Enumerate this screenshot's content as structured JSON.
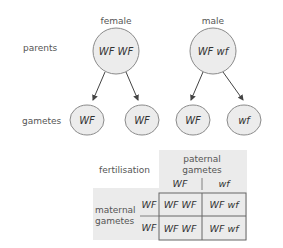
{
  "diagram": {
    "row_labels": {
      "parents": "parents",
      "gametes": "gametes"
    },
    "parents": [
      {
        "sex_label": "female",
        "genotype": "WF WF"
      },
      {
        "sex_label": "male",
        "genotype": "WF wf"
      }
    ],
    "gametes": [
      {
        "allele": "WF",
        "parent": "female"
      },
      {
        "allele": "WF",
        "parent": "female"
      },
      {
        "allele": "WF",
        "parent": "male"
      },
      {
        "allele": "wf",
        "parent": "male"
      }
    ],
    "punnett": {
      "title": "fertilisation",
      "column_header_line1": "paternal",
      "column_header_line2": "gametes",
      "row_header_line1": "maternal",
      "row_header_line2": "gametes",
      "columns": [
        "WF",
        "wf"
      ],
      "rows": [
        "WF",
        "WF"
      ],
      "cells": [
        [
          "WF WF",
          "WF wf"
        ],
        [
          "WF WF",
          "WF wf"
        ]
      ]
    },
    "colors": {
      "circle_fill": "#ececec",
      "circle_stroke": "#8a8a8a",
      "panel_fill": "#ebebeb",
      "grid_stroke": "#666666",
      "arrow": "#444444"
    }
  }
}
